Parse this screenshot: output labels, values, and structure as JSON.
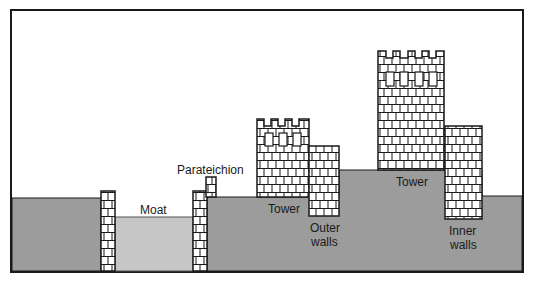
{
  "diagram": {
    "title_partial": "",
    "colors": {
      "ground": "#9c9c9c",
      "moat": "#c6c6c6",
      "sky": "#ffffff",
      "brick_fill": "#ffffff",
      "outline": "#1a1a1a"
    },
    "labels": {
      "moat": "Moat",
      "parateichion": "Parateichion",
      "tower_small": "Tower",
      "outer_walls_line1": "Outer",
      "outer_walls_line2": "walls",
      "tower_large": "Tower",
      "inner_walls_line1": "Inner",
      "inner_walls_line2": "walls"
    }
  }
}
